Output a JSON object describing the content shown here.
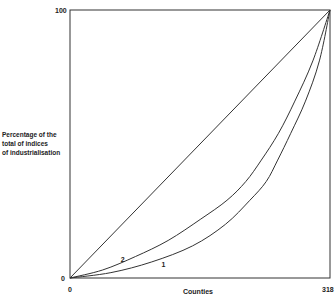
{
  "chart_data": {
    "type": "line",
    "title": "",
    "xlabel": "Counties",
    "ylabel": [
      "Percentage of the",
      "total of indices",
      "of industrialisation"
    ],
    "xlim": [
      0,
      318
    ],
    "ylim": [
      0,
      100
    ],
    "x_ticks": [
      "0",
      "318"
    ],
    "y_ticks": [
      "0",
      "100"
    ],
    "grid": false,
    "series": [
      {
        "name": "equality line",
        "label": "",
        "points": [
          [
            0,
            0
          ],
          [
            318,
            100
          ]
        ]
      },
      {
        "name": "curve 2",
        "label": "2",
        "points": [
          [
            0,
            0
          ],
          [
            40,
            3
          ],
          [
            80,
            8
          ],
          [
            120,
            14
          ],
          [
            160,
            22
          ],
          [
            192,
            29
          ],
          [
            215,
            36
          ],
          [
            234,
            44
          ],
          [
            255,
            54
          ],
          [
            275,
            66
          ],
          [
            297,
            81
          ],
          [
            318,
            100
          ]
        ]
      },
      {
        "name": "curve 1",
        "label": "1",
        "points": [
          [
            0,
            0
          ],
          [
            50,
            2
          ],
          [
            100,
            6
          ],
          [
            150,
            12
          ],
          [
            190,
            20
          ],
          [
            220,
            29
          ],
          [
            240,
            36
          ],
          [
            254,
            44
          ],
          [
            270,
            54
          ],
          [
            288,
            66
          ],
          [
            305,
            81
          ],
          [
            318,
            100
          ]
        ]
      }
    ],
    "annotations": [
      {
        "text": "2",
        "x": 62,
        "y": 6
      },
      {
        "text": "1",
        "x": 112,
        "y": 4
      }
    ]
  }
}
